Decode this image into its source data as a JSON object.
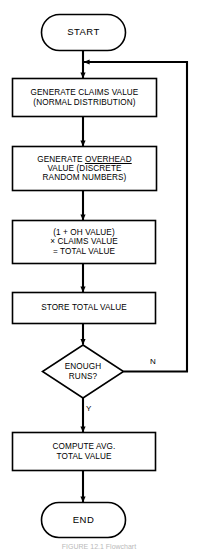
{
  "figure": {
    "type": "flowchart",
    "caption": "FIGURE 12.1   Flowchart",
    "line_color": "#000000",
    "background_color": "#ffffff"
  },
  "nodes": {
    "start": {
      "shape": "terminator",
      "label": "START"
    },
    "generate_claims": {
      "shape": "process",
      "lines": [
        "GENERATE CLAIMS VALUE",
        "(NORMAL DISTRIBUTION)"
      ]
    },
    "generate_overhead": {
      "shape": "process",
      "lines": [
        "GENERATE OVERHEAD",
        "VALUE  (DISCRETE",
        "RANDOM NUMBERS)"
      ],
      "underlined_word": "OVERHEAD"
    },
    "compute_total": {
      "shape": "process",
      "lines": [
        "(1 + OH VALUE)",
        "× CLAIMS VALUE",
        "= TOTAL VALUE"
      ]
    },
    "store_total": {
      "shape": "process",
      "lines": [
        "STORE TOTAL VALUE"
      ]
    },
    "enough_runs": {
      "shape": "decision",
      "lines": [
        "ENOUGH",
        "RUNS?"
      ]
    },
    "compute_average": {
      "shape": "process",
      "lines": [
        "COMPUTE AVG.",
        "TOTAL VALUE"
      ]
    },
    "end": {
      "shape": "terminator",
      "label": "END"
    }
  },
  "branches": {
    "no_label": "N",
    "yes_label": "Y"
  }
}
